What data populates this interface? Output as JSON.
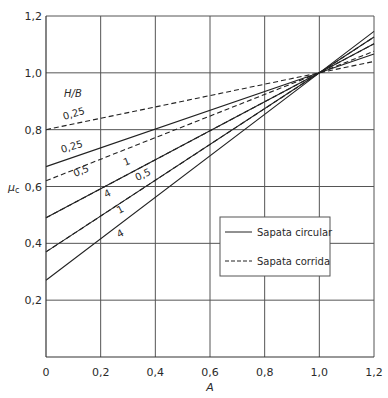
{
  "chart_data": {
    "type": "line",
    "title": "",
    "xlabel": "A",
    "ylabel": "μc",
    "xlim": [
      0,
      1.2
    ],
    "ylim": [
      0,
      1.2
    ],
    "grid": true,
    "x_ticks": [
      "0",
      "0,2",
      "0,4",
      "0,6",
      "0,8",
      "1,0",
      "1,2"
    ],
    "y_ticks": [
      "0,2",
      "0,4",
      "0,6",
      "0,8",
      "1,0",
      "1,2"
    ],
    "annotation_header": "H/B",
    "legend": {
      "position": "lower right",
      "entries": [
        {
          "label": "Sapata circular",
          "style": "solid"
        },
        {
          "label": "Sapata corrida",
          "style": "dashed"
        }
      ]
    },
    "x": [
      0,
      1.0,
      1.2
    ],
    "series": [
      {
        "name": "Sapata corrida H/B=0,25",
        "style": "dashed",
        "label": "0,25",
        "values": [
          0.8,
          1.0,
          1.04
        ]
      },
      {
        "name": "Sapata corrida H/B=0,5",
        "style": "dashed",
        "label": "0,5",
        "values": [
          0.62,
          1.0,
          1.076
        ]
      },
      {
        "name": "Sapata corrida H/B=1",
        "style": "dashed",
        "label": "1",
        "values": [
          0.49,
          1.0,
          1.102
        ]
      },
      {
        "name": "Sapata corrida H/B=4",
        "style": "dashed",
        "label": "4",
        "values": [
          0.37,
          1.0,
          1.126
        ]
      },
      {
        "name": "Sapata circular H/B=0,25",
        "style": "solid",
        "label": "0,25",
        "values": [
          0.67,
          1.0,
          1.066
        ]
      },
      {
        "name": "Sapata circular H/B=0,5",
        "style": "solid",
        "label": "0,5",
        "values": [
          0.49,
          1.0,
          1.102
        ]
      },
      {
        "name": "Sapata circular H/B=1",
        "style": "solid",
        "label": "1",
        "values": [
          0.37,
          1.0,
          1.126
        ]
      },
      {
        "name": "Sapata circular H/B=4",
        "style": "solid",
        "label": "4",
        "values": [
          0.27,
          1.0,
          1.146
        ]
      }
    ]
  }
}
